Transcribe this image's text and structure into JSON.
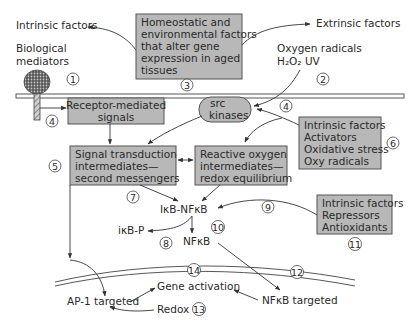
{
  "diagram": {
    "colors": {
      "box_fill": "#b8b8b8",
      "box_stroke": "#555555",
      "line": "#333333",
      "background": "#ffffff"
    },
    "labels": {
      "intrinsic_top": "Intrinsic factors",
      "extrinsic_top": "Extrinsic factors",
      "bio_mediators_1": "Biological",
      "bio_mediators_2": "mediators",
      "oxygen_radicals": "Oxygen radicals",
      "h2o2_uv": "H₂O₂ UV",
      "ikb_nfkb": "IκB-NFκB",
      "ikb_p": "iκB-P",
      "nfkb": "NFκB",
      "gene_activation": "Gene activation",
      "ap1_targeted": "AP-1 targeted",
      "redox": "Redox",
      "nfkb_targeted": "NFκB targeted"
    },
    "boxes": {
      "homeostatic": [
        "Homeostatic and",
        "environmental factors",
        "that alter gene",
        "expression in aged",
        "tissues"
      ],
      "receptor": [
        "Receptor-mediated",
        "signals"
      ],
      "src": [
        "src",
        "kinases"
      ],
      "signal": [
        "Signal transduction",
        "intermediates—",
        "second messengers"
      ],
      "reactive": [
        "Reactive oxygen",
        "intermediates—",
        "redox equilibrium"
      ],
      "activators": [
        "Intrinsic factors",
        "Activators",
        "Oxidative stress",
        "Oxy radicals"
      ],
      "repressors": [
        "Intrinsic factors",
        "Repressors",
        "Antioxidants"
      ]
    },
    "numbers": [
      "1",
      "2",
      "3",
      "4",
      "4",
      "5",
      "6",
      "7",
      "8",
      "9",
      "10",
      "11",
      "12",
      "13",
      "14"
    ]
  }
}
